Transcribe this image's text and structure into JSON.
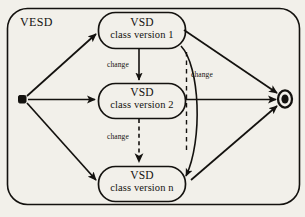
{
  "diagram": {
    "type": "uml-state-diagram",
    "frame": {
      "label": "VESD"
    },
    "colors": {
      "background": "#f2f0ea",
      "stroke": "#14120f",
      "text": "#14120f"
    },
    "nodes": [
      {
        "id": "start",
        "kind": "initial-state",
        "label": ""
      },
      {
        "id": "version-1",
        "kind": "state",
        "title": "VSD",
        "subtitle": "class version 1"
      },
      {
        "id": "version-2",
        "kind": "state",
        "title": "VSD",
        "subtitle": "class version 2"
      },
      {
        "id": "version-n",
        "kind": "state",
        "title": "VSD",
        "subtitle": "class version n"
      },
      {
        "id": "end",
        "kind": "final-state",
        "label": ""
      }
    ],
    "edges": [
      {
        "id": "start-to-v1",
        "from": "start",
        "to": "version-1",
        "style": "solid",
        "label": ""
      },
      {
        "id": "start-to-v2",
        "from": "start",
        "to": "version-2",
        "style": "solid",
        "label": ""
      },
      {
        "id": "start-to-vn",
        "from": "start",
        "to": "version-n",
        "style": "solid",
        "label": ""
      },
      {
        "id": "v1-to-v2",
        "from": "version-1",
        "to": "version-2",
        "style": "solid",
        "label": "change"
      },
      {
        "id": "v2-to-vn",
        "from": "version-2",
        "to": "version-n",
        "style": "dashed",
        "label": "change"
      },
      {
        "id": "v1-to-vn",
        "from": "version-1",
        "to": "version-n",
        "style": "solid",
        "label": "change"
      },
      {
        "id": "v1-to-end",
        "from": "version-1",
        "to": "end",
        "style": "solid",
        "label": ""
      },
      {
        "id": "v2-to-end",
        "from": "version-2",
        "to": "end",
        "style": "solid",
        "label": ""
      },
      {
        "id": "vn-to-end",
        "from": "version-n",
        "to": "end",
        "style": "solid",
        "label": ""
      }
    ],
    "edge_labels": {
      "change_1": "change",
      "change_2": "change",
      "change_3": "change"
    }
  }
}
